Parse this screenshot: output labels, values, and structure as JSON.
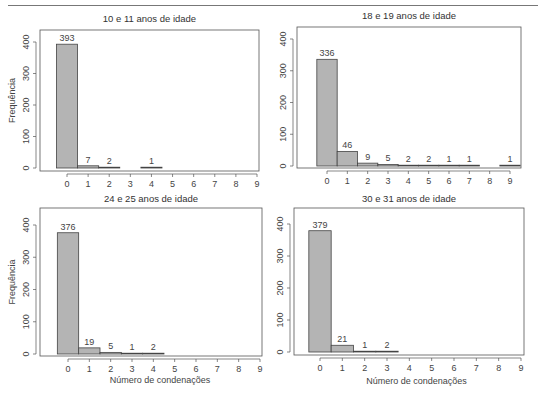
{
  "chart_data": [
    {
      "type": "bar",
      "title": "10 e 11 anos de idade",
      "xlabel": "",
      "ylabel": "Frequência",
      "categories": [
        "0",
        "1",
        "2",
        "3",
        "4",
        "5",
        "6",
        "7",
        "8",
        "9"
      ],
      "values": [
        393,
        7,
        2,
        0,
        1,
        0,
        0,
        0,
        0,
        0
      ],
      "data_labels": [
        "393",
        "7",
        "2",
        "",
        "1",
        "",
        "",
        "",
        "",
        ""
      ],
      "yticks": [
        "0",
        "100",
        "200",
        "300",
        "400"
      ],
      "ylim": [
        0,
        400
      ],
      "grid": false
    },
    {
      "type": "bar",
      "title": "18 e 19 anos de idade",
      "xlabel": "",
      "ylabel": "",
      "categories": [
        "0",
        "1",
        "2",
        "3",
        "4",
        "5",
        "6",
        "7",
        "8",
        "9"
      ],
      "values": [
        336,
        46,
        9,
        5,
        2,
        2,
        1,
        1,
        0,
        1
      ],
      "data_labels": [
        "336",
        "46",
        "9",
        "5",
        "2",
        "2",
        "1",
        "1",
        "",
        "1"
      ],
      "yticks": [
        "0",
        "100",
        "200",
        "300",
        "400"
      ],
      "ylim": [
        0,
        400
      ],
      "grid": false
    },
    {
      "type": "bar",
      "title": "24 e 25 anos de idade",
      "xlabel": "Número de condenações",
      "ylabel": "Frequência",
      "categories": [
        "0",
        "1",
        "2",
        "3",
        "4",
        "5",
        "6",
        "7",
        "8",
        "9"
      ],
      "values": [
        376,
        19,
        5,
        1,
        2,
        0,
        0,
        0,
        0,
        0
      ],
      "data_labels": [
        "376",
        "19",
        "5",
        "1",
        "2",
        "",
        "",
        "",
        "",
        ""
      ],
      "yticks": [
        "0",
        "100",
        "200",
        "300",
        "400"
      ],
      "ylim": [
        0,
        400
      ],
      "grid": false
    },
    {
      "type": "bar",
      "title": "30 e 31 anos de idade",
      "xlabel": "Número de condenações",
      "ylabel": "",
      "categories": [
        "0",
        "1",
        "2",
        "3",
        "4",
        "5",
        "6",
        "7",
        "8",
        "9"
      ],
      "values": [
        379,
        21,
        1,
        2,
        0,
        0,
        0,
        0,
        0,
        0
      ],
      "data_labels": [
        "379",
        "21",
        "1",
        "2",
        "",
        "",
        "",
        "",
        "",
        ""
      ],
      "yticks": [
        "0",
        "100",
        "200",
        "300",
        "400"
      ],
      "ylim": [
        0,
        400
      ],
      "grid": false
    }
  ],
  "colors": {
    "bar_fill": "#b4b4b4",
    "bar_stroke": "#444444",
    "axis": "#555555"
  }
}
